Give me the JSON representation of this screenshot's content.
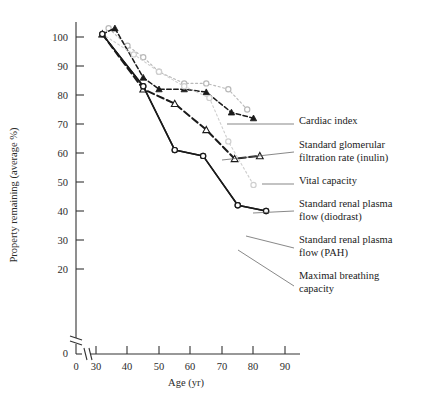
{
  "chart_data": {
    "type": "line",
    "title": "",
    "xlabel": "Age (yr)",
    "ylabel": "Property remaining (average %)",
    "xlim": [
      30,
      90
    ],
    "ylim": [
      0,
      105
    ],
    "x_ticks": [
      0,
      30,
      40,
      50,
      60,
      70,
      80,
      90
    ],
    "y_ticks": [
      0,
      20,
      30,
      40,
      50,
      60,
      70,
      80,
      90,
      100
    ],
    "axis_break_x": true,
    "axis_break_y": true,
    "grid": false,
    "legend_position": "right-annotations",
    "series": [
      {
        "name": "Cardiac index",
        "marker": "open-circle",
        "line_style": "dotted",
        "color": "#b9b9b9",
        "x": [
          34,
          40,
          45,
          50,
          58,
          65,
          72,
          78
        ],
        "y": [
          103,
          97,
          93,
          88,
          84,
          84,
          82,
          75
        ]
      },
      {
        "name": "Standard glomerular filtration rate (inulin)",
        "marker": "filled-triangle",
        "line_style": "dashed-fine",
        "color": "#1a1a1a",
        "x": [
          32,
          36,
          45,
          50,
          58,
          65,
          73,
          80
        ],
        "y": [
          101,
          103,
          86,
          82,
          82,
          81,
          74,
          72
        ]
      },
      {
        "name": "Vital capacity",
        "marker": "open-triangle",
        "line_style": "dashed-bold",
        "color": "#1a1a1a",
        "x": [
          32,
          45,
          55,
          65,
          74,
          82
        ],
        "y": [
          101,
          82,
          77,
          68,
          58,
          59
        ]
      },
      {
        "name": "Standard renal plasma flow (diodrast)",
        "marker": "open-circle",
        "line_style": "dotted",
        "color": "#cfcfcf",
        "x": [
          32,
          42,
          50,
          58,
          66,
          72,
          80
        ],
        "y": [
          101,
          94,
          88,
          83,
          79,
          64,
          49
        ]
      },
      {
        "name": "Standard renal plasma flow (PAH)",
        "marker": "open-circle",
        "line_style": "solid",
        "color": "#1a1a1a",
        "x": [
          32,
          45,
          55,
          64,
          75,
          84
        ],
        "y": [
          101,
          83,
          61,
          59,
          42,
          40
        ]
      },
      {
        "name": "Maximal breathing capacity",
        "marker": "open-circle",
        "line_style": "solid",
        "color": "#1a1a1a",
        "x": [
          32,
          45,
          55,
          64,
          75,
          84
        ],
        "y": [
          101,
          83,
          61,
          59,
          42,
          40
        ]
      }
    ],
    "annotations": [
      {
        "label": "Cardiac index",
        "lines": [
          "Cardiac index"
        ]
      },
      {
        "label": "Standard glomerular filtration rate (inulin)",
        "lines": [
          "Standard glomerular",
          "filtration rate (inulin)"
        ]
      },
      {
        "label": "Vital capacity",
        "lines": [
          "Vital capacity"
        ]
      },
      {
        "label": "Standard renal plasma flow (diodrast)",
        "lines": [
          "Standard renal plasma",
          "flow (diodrast)"
        ]
      },
      {
        "label": "Standard renal plasma flow (PAH)",
        "lines": [
          "Standard renal plasma",
          "flow (PAH)"
        ]
      },
      {
        "label": "Maximal breathing capacity",
        "lines": [
          "Maximal breathing",
          "capacity"
        ]
      }
    ]
  },
  "axis": {
    "y_title": "Property remaining (average %)",
    "x_title": "Age (yr)",
    "y_tick_labels": [
      "100",
      "90",
      "80",
      "70",
      "60",
      "50",
      "40",
      "30",
      "20",
      "0"
    ],
    "x_tick_labels": [
      "0",
      "30",
      "40",
      "50",
      "60",
      "70",
      "80",
      "90"
    ]
  }
}
